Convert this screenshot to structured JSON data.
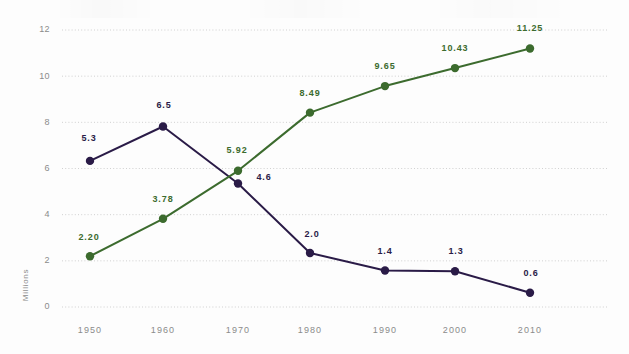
{
  "chart_data": {
    "type": "line",
    "title": "",
    "subtitle": "",
    "xlabel": "",
    "ylabel": "Millions",
    "categories": [
      "1950",
      "1960",
      "1970",
      "1980",
      "1990",
      "2000",
      "2010"
    ],
    "x_tick_labels": [
      "1950",
      "1960",
      "1970",
      "1980",
      "1990",
      "2000",
      "2010"
    ],
    "y_tick_labels": [
      "0",
      "2",
      "4",
      "6",
      "8",
      "10",
      "12"
    ],
    "y_ticks": [
      0,
      2,
      4,
      6,
      8,
      10,
      12
    ],
    "ylim": [
      0,
      12
    ],
    "grid": true,
    "grid_axis": "y",
    "legend": "none",
    "series": [
      {
        "name": "purple-series",
        "color": "#2a1b47",
        "label_color": "#2a1b47",
        "values": [
          5.3,
          6.5,
          4.6,
          2.0,
          1.4,
          1.3,
          0.6
        ],
        "data_labels": [
          "5.3",
          "6.5",
          "4.6",
          "2.0",
          "1.4",
          "1.3",
          "0.6"
        ],
        "plotted": [
          6.33,
          7.82,
          5.35,
          2.34,
          1.58,
          1.55,
          0.62
        ],
        "label_offsets": [
          {
            "dx": -1,
            "dy": -20
          },
          {
            "dx": 1,
            "dy": -18
          },
          {
            "dx": 26,
            "dy": -4
          },
          {
            "dx": 2,
            "dy": -16
          },
          {
            "dx": 0,
            "dy": -17
          },
          {
            "dx": 1,
            "dy": -17
          },
          {
            "dx": 1,
            "dy": -17
          }
        ]
      },
      {
        "name": "green-series",
        "color": "#3c6b2e",
        "label_color": "#3c6b2e",
        "values": [
          2.2,
          3.78,
          5.92,
          8.49,
          9.65,
          10.43,
          11.25
        ],
        "data_labels": [
          "2.20",
          "3.78",
          "5.92",
          "8.49",
          "9.65",
          "10.43",
          "11.25"
        ],
        "plotted": [
          2.2,
          3.82,
          5.9,
          8.42,
          9.57,
          10.35,
          11.2
        ],
        "label_offsets": [
          {
            "dx": -1,
            "dy": -16
          },
          {
            "dx": 0,
            "dy": -17
          },
          {
            "dx": -1,
            "dy": -18
          },
          {
            "dx": 0,
            "dy": -17
          },
          {
            "dx": 0,
            "dy": -17
          },
          {
            "dx": 0,
            "dy": -17
          },
          {
            "dx": 0,
            "dy": -17
          }
        ]
      }
    ]
  }
}
